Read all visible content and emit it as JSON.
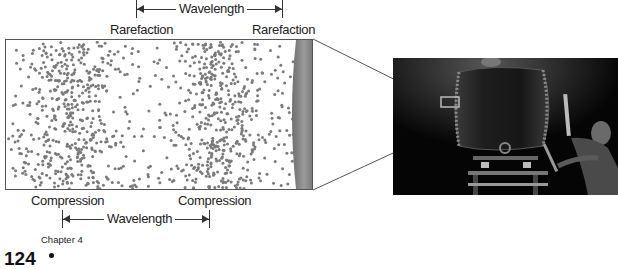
{
  "diagram": {
    "top_labels": {
      "wavelength": "Wavelength",
      "rarefaction_left": "Rarefaction",
      "rarefaction_right": "Rarefaction"
    },
    "bottom_labels": {
      "compression_left": "Compression",
      "compression_right": "Compression",
      "wavelength": "Wavelength"
    },
    "colors": {
      "particle": "#7a7a7a",
      "border": "#555555",
      "drum_edge": "#8a8a8a",
      "text": "#222222"
    },
    "compression_centers_px": [
      65,
      210
    ],
    "wavelength_px": 146
  },
  "photo": {
    "description": "Taiko drum being struck by a drummer, with highlighted zoom region on drum head",
    "background": "#050505"
  },
  "footer": {
    "page_number": "124",
    "chapter": "Chapter 4"
  }
}
